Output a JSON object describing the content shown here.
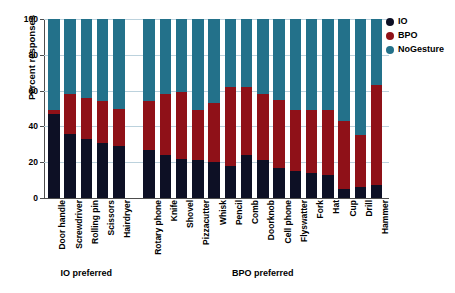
{
  "chart_data": {
    "type": "bar",
    "subtype": "stacked-percentage",
    "title": "",
    "xlabel": "",
    "ylabel": "Percent responses",
    "ylim": [
      0,
      100
    ],
    "yticks": [
      0,
      20,
      40,
      60,
      80,
      100
    ],
    "grid": true,
    "legend_position": "top-right",
    "categories": [
      "Door handle",
      "Screwdriver",
      "Rolling pin",
      "Scissors",
      "Hairdryer",
      "Rotary phone",
      "Knife",
      "Shovel",
      "Pizzacutter",
      "Whisk",
      "Pencil",
      "Comb",
      "Doorknob",
      "Cell phone",
      "Flyswatter",
      "Fork",
      "Hat",
      "Cup",
      "Drill",
      "Hammer"
    ],
    "series": [
      {
        "name": "IO",
        "color": "#0d1025",
        "values": [
          47,
          36,
          33,
          31,
          29,
          27,
          24,
          22,
          21,
          20,
          18,
          24,
          21,
          17,
          15,
          14,
          13,
          5,
          6,
          7
        ]
      },
      {
        "name": "BPO",
        "color": "#8f1118",
        "values": [
          2,
          22,
          23,
          23,
          21,
          27,
          34,
          37,
          28,
          33,
          44,
          38,
          37,
          38,
          34,
          35,
          36,
          38,
          29,
          56
        ]
      },
      {
        "name": "NoGesture",
        "color": "#23718a",
        "values": [
          51,
          42,
          44,
          46,
          50,
          46,
          42,
          41,
          51,
          47,
          38,
          38,
          42,
          45,
          51,
          51,
          51,
          57,
          65,
          37
        ]
      }
    ],
    "groups": [
      {
        "label": "IO preferred",
        "start": 0,
        "end": 4
      },
      {
        "label": "BPO preferred",
        "start": 5,
        "end": 19
      }
    ]
  },
  "legend": {
    "items": [
      {
        "label": "IO",
        "color": "#0d1025"
      },
      {
        "label": "BPO",
        "color": "#8f1118"
      },
      {
        "label": "NoGesture",
        "color": "#23718a"
      }
    ]
  }
}
